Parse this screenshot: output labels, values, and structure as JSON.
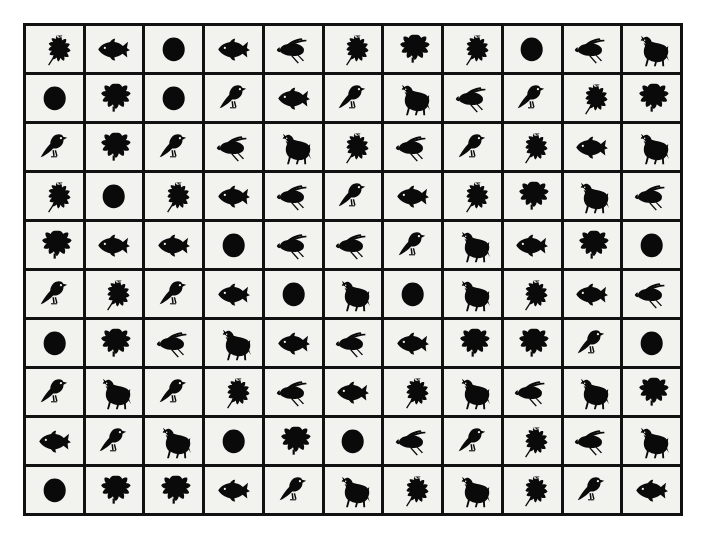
{
  "page": {
    "background_color": "#ffffff",
    "cell_background_color": "#f2f2ee",
    "grid_line_color": "#111111",
    "icon_color": "#0a0a0a"
  },
  "grid": {
    "columns": 11,
    "rows": 10,
    "total_cells": 110,
    "icon_types": [
      "oak-leaf",
      "maple-leaf",
      "fish",
      "circle",
      "bee",
      "bird",
      "horse"
    ],
    "cells": [
      [
        "oak-leaf",
        "fish",
        "circle",
        "fish",
        "bee",
        "oak-leaf",
        "maple-leaf",
        "oak-leaf",
        "circle",
        "bee",
        "horse"
      ],
      [
        "circle",
        "maple-leaf",
        "circle",
        "bird",
        "fish",
        "bird",
        "horse",
        "bee",
        "bird",
        "oak-leaf",
        "maple-leaf"
      ],
      [
        "bird",
        "maple-leaf",
        "bird",
        "bee",
        "horse",
        "oak-leaf",
        "bee",
        "bird",
        "oak-leaf",
        "fish",
        "horse"
      ],
      [
        "oak-leaf",
        "circle",
        "oak-leaf",
        "fish",
        "bee",
        "bird",
        "fish",
        "oak-leaf",
        "maple-leaf",
        "horse",
        "bee"
      ],
      [
        "maple-leaf",
        "fish",
        "fish",
        "circle",
        "bee",
        "bee",
        "bird",
        "horse",
        "fish",
        "maple-leaf",
        "circle"
      ],
      [
        "bird",
        "oak-leaf",
        "bird",
        "fish",
        "circle",
        "horse",
        "circle",
        "horse",
        "oak-leaf",
        "fish",
        "bee"
      ],
      [
        "circle",
        "maple-leaf",
        "bee",
        "horse",
        "fish",
        "bee",
        "fish",
        "maple-leaf",
        "maple-leaf",
        "bird",
        "circle"
      ],
      [
        "bird",
        "horse",
        "bird",
        "oak-leaf",
        "bee",
        "fish",
        "oak-leaf",
        "horse",
        "bee",
        "horse",
        "maple-leaf"
      ],
      [
        "fish",
        "bird",
        "horse",
        "circle",
        "maple-leaf",
        "circle",
        "bee",
        "bird",
        "oak-leaf",
        "bee",
        "horse"
      ],
      [
        "circle",
        "maple-leaf",
        "maple-leaf",
        "fish",
        "bird",
        "horse",
        "oak-leaf",
        "horse",
        "oak-leaf",
        "bird",
        "fish"
      ]
    ],
    "counts": {
      "oak-leaf": 16,
      "maple-leaf": 15,
      "fish": 17,
      "circle": 14,
      "bee": 16,
      "bird": 17,
      "horse": 15
    }
  }
}
